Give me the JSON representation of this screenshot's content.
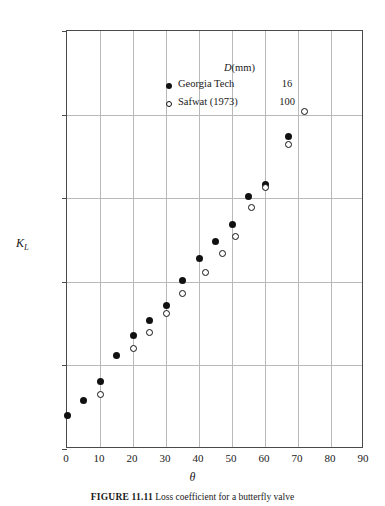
{
  "figure": {
    "caption_label": "FIGURE 11.11",
    "caption_text": "Loss coefficient for a butterfly valve",
    "xlabel": "θ",
    "ylabel_main": "K",
    "ylabel_sub": "L"
  },
  "legend": {
    "header_symbol": "D",
    "header_unit": "(mm)",
    "entries": [
      {
        "marker": "filled-circle",
        "label": "Georgia Tech",
        "diameter": "16"
      },
      {
        "marker": "open-circle",
        "label": "Safwat (1973)",
        "diameter": "100"
      }
    ]
  },
  "axes": {
    "x": {
      "min": 0,
      "max": 90,
      "step": 10,
      "ticks": [
        "0",
        "10",
        "20",
        "30",
        "40",
        "50",
        "60",
        "70",
        "80",
        "90"
      ]
    },
    "y": {
      "scale": "log10",
      "min_exp": -1,
      "max_exp": 4,
      "ticks": [
        {
          "mantissa": "10",
          "exp": "4"
        },
        {
          "mantissa": "10",
          "exp": "3"
        },
        {
          "mantissa": "10",
          "exp": "2"
        },
        {
          "mantissa": "10",
          "exp": "1"
        },
        {
          "mantissa": "10",
          "exp": "0"
        },
        {
          "mantissa": "10",
          "exp": "-1"
        }
      ]
    }
  },
  "chart_data": {
    "type": "scatter",
    "title": "Loss coefficient for a butterfly valve",
    "xlabel": "θ",
    "ylabel": "K_L",
    "xscale": "linear",
    "yscale": "log",
    "xlim": [
      0,
      90
    ],
    "ylim": [
      0.1,
      10000
    ],
    "grid": true,
    "legend_position": "top-center",
    "series": [
      {
        "name": "Georgia Tech",
        "diameter_mm": 16,
        "marker": "filled-circle",
        "points": [
          {
            "x": 0,
            "y": 0.25
          },
          {
            "x": 5,
            "y": 0.38
          },
          {
            "x": 10,
            "y": 0.65
          },
          {
            "x": 15,
            "y": 1.3
          },
          {
            "x": 20,
            "y": 2.3
          },
          {
            "x": 25,
            "y": 3.4
          },
          {
            "x": 30,
            "y": 5.2
          },
          {
            "x": 35,
            "y": 10.5
          },
          {
            "x": 40,
            "y": 19
          },
          {
            "x": 45,
            "y": 30
          },
          {
            "x": 50,
            "y": 49
          },
          {
            "x": 55,
            "y": 105
          },
          {
            "x": 60,
            "y": 145
          },
          {
            "x": 67,
            "y": 540
          }
        ]
      },
      {
        "name": "Safwat (1973)",
        "diameter_mm": 100,
        "marker": "open-circle",
        "points": [
          {
            "x": 10,
            "y": 0.45
          },
          {
            "x": 20,
            "y": 1.6
          },
          {
            "x": 25,
            "y": 2.5
          },
          {
            "x": 30,
            "y": 4.2
          },
          {
            "x": 35,
            "y": 7.3
          },
          {
            "x": 42,
            "y": 13
          },
          {
            "x": 47,
            "y": 22
          },
          {
            "x": 51,
            "y": 35
          },
          {
            "x": 56,
            "y": 78
          },
          {
            "x": 60,
            "y": 135
          },
          {
            "x": 67,
            "y": 440
          },
          {
            "x": 72,
            "y": 1100
          }
        ]
      }
    ]
  }
}
